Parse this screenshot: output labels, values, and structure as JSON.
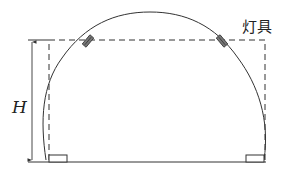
{
  "diagram": {
    "type": "tunnel-cross-section-lighting",
    "labels": {
      "height_label": "H",
      "fixture_label": "灯具"
    },
    "colors": {
      "line": "#333333",
      "background": "#ffffff"
    }
  }
}
